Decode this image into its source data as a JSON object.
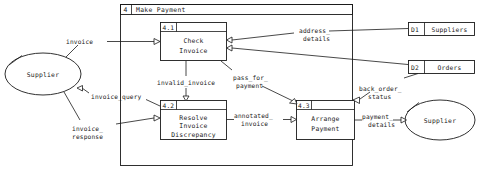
{
  "diagram": {
    "title_number": "4",
    "title_label": "Make Payment"
  },
  "processes": [
    {
      "id": "4.1",
      "name_line1": "Check",
      "name_line2": "Invoice",
      "name_line3": ""
    },
    {
      "id": "4.2",
      "name_line1": "Resolve",
      "name_line2": "Invoice",
      "name_line3": "Discrepancy"
    },
    {
      "id": "4.3",
      "name_line1": "Arrange",
      "name_line2": "Payment",
      "name_line3": ""
    }
  ],
  "datastores": [
    {
      "id": "D1",
      "name": "Suppliers"
    },
    {
      "id": "D2",
      "name": "Orders"
    }
  ],
  "entities": [
    {
      "name": "Supplier"
    },
    {
      "name": "Supplier"
    }
  ],
  "flows": [
    {
      "label_line1": "invoice",
      "label_line2": ""
    },
    {
      "label_line1": "invoice_query",
      "label_line2": ""
    },
    {
      "label_line1": "invoice_",
      "label_line2": "response"
    },
    {
      "label_line1": "invalid_invoice",
      "label_line2": ""
    },
    {
      "label_line1": "pass_for_",
      "label_line2": "payment"
    },
    {
      "label_line1": "address_",
      "label_line2": "details"
    },
    {
      "label_line1": "annotated_",
      "label_line2": "invoice"
    },
    {
      "label_line1": "back_order_",
      "label_line2": "status"
    },
    {
      "label_line1": "payment_",
      "label_line2": "details"
    }
  ],
  "colors": {
    "ink": "#1a1a1a",
    "paper": "#ffffff"
  }
}
